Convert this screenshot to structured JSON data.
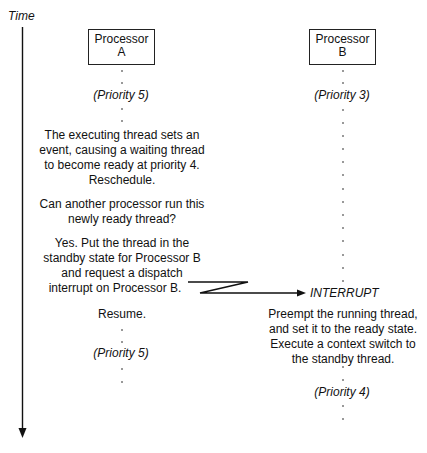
{
  "diagram": {
    "axis": {
      "label": "Time",
      "direction": "down"
    },
    "processors": [
      {
        "name_line1": "Processor",
        "name_line2": "A",
        "start_priority": "(Priority 5)",
        "steps": [
          "The executing thread sets an",
          "event, causing a waiting thread",
          "to become ready at priority 4.",
          "Reschedule."
        ],
        "question": [
          "Can another processor run this",
          "newly ready thread?"
        ],
        "answer": [
          "Yes. Put the thread in the",
          "standby state for Processor B",
          "and request a dispatch",
          "interrupt on Processor B."
        ],
        "resume": "Resume.",
        "end_priority": "(Priority 5)"
      },
      {
        "name_line1": "Processor",
        "name_line2": "B",
        "start_priority": "(Priority 3)",
        "interrupt_label": "INTERRUPT",
        "actions": [
          "Preempt the running thread,",
          "and set it to the ready state.",
          "Execute a context switch to",
          "the standby thread."
        ],
        "end_priority": "(Priority 4)"
      }
    ],
    "colors": {
      "ink": "#111111",
      "line": "#222222",
      "dot": "#777777",
      "background": "#ffffff"
    }
  }
}
